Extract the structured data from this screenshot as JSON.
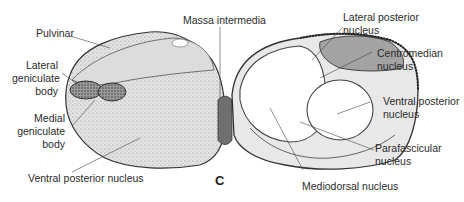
{
  "figure": {
    "panel_letter": "C",
    "labels": {
      "pulvinar": "Pulvinar",
      "lateral_geniculate": [
        "Lateral",
        "geniculate",
        "body"
      ],
      "medial_geniculate": [
        "Medial",
        "geniculate",
        "body"
      ],
      "ventral_posterior_left": "Ventral posterior nucleus",
      "massa_intermedia": "Massa intermedia",
      "lateral_posterior": [
        "Lateral posterior",
        "nucleus"
      ],
      "centromedian": [
        "Centromedian",
        "nucleus"
      ],
      "ventral_posterior_right": [
        "Ventral posterior",
        "nucleus"
      ],
      "parafascicular": [
        "Parafascicular",
        "nucleus"
      ],
      "mediodorsal": "Mediodorsal nucleus"
    },
    "colors": {
      "stipple_fill": "#d9d9d9",
      "dark_region": "#7a7a7a",
      "lateral_posterior_fill": "#9a9a9a",
      "light_region": "#e6e6e6",
      "white_region": "#ffffff",
      "outline": "#333333"
    },
    "caption_partial": "…"
  }
}
